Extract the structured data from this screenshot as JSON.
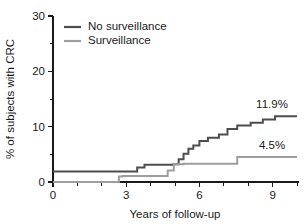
{
  "chart_data": {
    "type": "line",
    "title": "",
    "subtitle": "",
    "xlabel": "Years of follow-up",
    "ylabel": "% of subjects with CRC",
    "xlim": [
      0,
      10
    ],
    "ylim": [
      0,
      30
    ],
    "grid": false,
    "legend_position": "top-left",
    "x_ticks_major": [
      0,
      3,
      6,
      9
    ],
    "x_ticks_major_labels": [
      "0",
      "3",
      "6",
      "9"
    ],
    "x_ticks_minor": [
      1,
      2,
      4,
      5,
      7,
      8,
      10
    ],
    "y_ticks_major": [
      0,
      10,
      20,
      30
    ],
    "y_ticks_major_labels": [
      "0",
      "10",
      "20",
      "30"
    ],
    "y_ticks_minor": [
      5,
      15,
      25
    ],
    "step_interpolation": "post",
    "series": [
      {
        "name": "No surveillance",
        "color": "#4d4d4d",
        "endpoint_label": "11.9%",
        "endpoint_value": 11.9,
        "x": [
          0,
          3.45,
          3.45,
          3.75,
          3.75,
          4.95,
          4.95,
          5.15,
          5.15,
          5.35,
          5.35,
          5.55,
          5.55,
          5.75,
          5.75,
          6.0,
          6.0,
          6.35,
          6.35,
          6.8,
          6.8,
          7.15,
          7.15,
          7.55,
          7.55,
          8.1,
          8.1,
          8.6,
          8.6,
          9.1,
          9.1,
          10.0
        ],
        "y": [
          1.9,
          1.9,
          2.6,
          2.6,
          3.1,
          3.1,
          3.2,
          3.2,
          4.1,
          4.1,
          5.1,
          5.1,
          6.0,
          6.0,
          6.6,
          6.6,
          7.4,
          7.4,
          8.0,
          8.0,
          8.6,
          8.6,
          9.6,
          9.6,
          10.2,
          10.2,
          10.7,
          10.7,
          11.3,
          11.3,
          11.9,
          11.9
        ]
      },
      {
        "name": "Surveillance",
        "color": "#9e9e9e",
        "endpoint_label": "4.5%",
        "endpoint_value": 4.5,
        "x": [
          0,
          2.7,
          2.7,
          2.85,
          2.85,
          4.7,
          4.7,
          4.95,
          4.95,
          5.35,
          5.35,
          7.55,
          7.55,
          10.0
        ],
        "y": [
          0.0,
          0.0,
          1.0,
          1.0,
          1.1,
          1.1,
          2.1,
          2.1,
          3.2,
          3.2,
          3.3,
          3.3,
          4.5,
          4.5
        ]
      }
    ]
  },
  "legend": {
    "items": [
      {
        "label": "No surveillance",
        "color": "#4d4d4d"
      },
      {
        "label": "Surveillance",
        "color": "#9e9e9e"
      }
    ]
  },
  "axes": {
    "x_title": "Years of follow-up",
    "y_title": "% of subjects with CRC"
  }
}
